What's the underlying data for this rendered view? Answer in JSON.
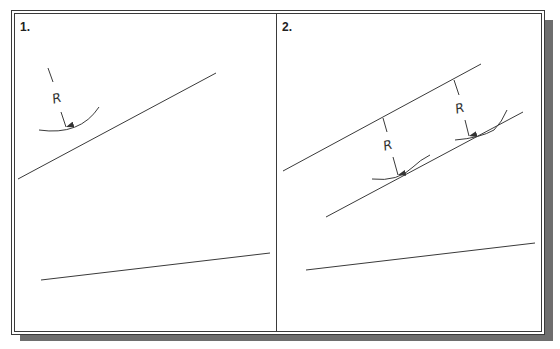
{
  "panels": [
    {
      "label": "1.",
      "dimension_labels": [
        "R"
      ]
    },
    {
      "label": "2.",
      "dimension_labels": [
        "R",
        "R"
      ]
    }
  ],
  "colors": {
    "line": "#3a3a3a",
    "shadow": "#6e6e6e",
    "background": "#ffffff"
  }
}
